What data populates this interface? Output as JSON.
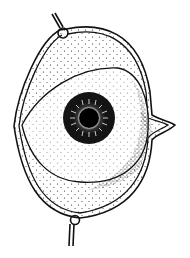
{
  "figure": {
    "style": "stippled line drawing",
    "colors": {
      "ink": "#111111",
      "background": "#ffffff",
      "iris": "#1a1a1a",
      "pupil": "#000000"
    }
  }
}
